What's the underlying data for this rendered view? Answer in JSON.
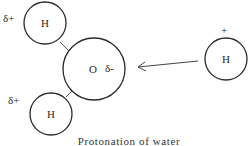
{
  "diagram": {
    "caption": "Protonation of water",
    "colors": {
      "stroke": "#2b2b2b",
      "background": "#ffffff"
    },
    "atoms": [
      {
        "id": "h-top-left",
        "label": "H",
        "charge": "δ+",
        "cx": 45,
        "cy": 23,
        "r": 21,
        "charge_x": 3,
        "charge_y": 22
      },
      {
        "id": "oxygen",
        "label": "O",
        "charge": "δ-",
        "cx": 94,
        "cy": 69,
        "r": 31,
        "charge_x": 105,
        "charge_y": 72
      },
      {
        "id": "h-bottom-left",
        "label": "H",
        "charge": "δ+",
        "cx": 51,
        "cy": 114,
        "r": 21,
        "charge_x": 8,
        "charge_y": 104
      },
      {
        "id": "h-proton",
        "label": "H",
        "charge": "+",
        "cx": 226,
        "cy": 59,
        "r": 21,
        "charge_x": 221,
        "charge_y": 34
      }
    ],
    "bonds": [
      {
        "from": "h-top-left",
        "to": "oxygen"
      },
      {
        "from": "h-bottom-left",
        "to": "oxygen"
      }
    ],
    "arrow": {
      "from": "h-proton",
      "to": "oxygen",
      "direction": "left"
    }
  }
}
